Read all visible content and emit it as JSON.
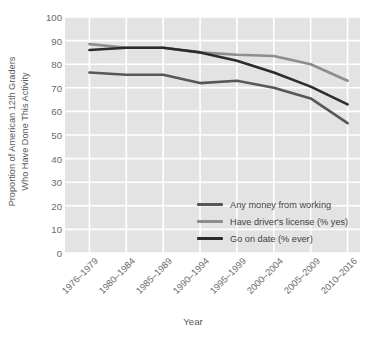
{
  "chart_data": {
    "type": "line",
    "title": "",
    "xlabel": "Year",
    "ylabel": "Proportion of American 12th Graders Who Have Done This Activity",
    "ylabel_lines": [
      "Proportion of American 12th Graders",
      "Who Have Done This Activity"
    ],
    "categories": [
      "1976–1979",
      "1980–1984",
      "1985–1989",
      "1990–1994",
      "1995–1999",
      "2000–2004",
      "2005–2009",
      "2010–2016"
    ],
    "ylim": [
      0,
      100
    ],
    "yticks": [
      0,
      10,
      20,
      30,
      40,
      50,
      60,
      70,
      80,
      90,
      100
    ],
    "ytick_labels": [
      "0",
      "10",
      "20",
      "30",
      "40",
      "50",
      "60",
      "70",
      "80",
      "90",
      "100"
    ],
    "grid": true,
    "grid_color": "#ffffff",
    "plot_bg": "#e3e3e3",
    "legend_position": "lower right",
    "series": [
      {
        "name": "Any money from working",
        "color": "#575759",
        "values": [
          76.5,
          75.5,
          75.5,
          72,
          73,
          70,
          65.5,
          55
        ]
      },
      {
        "name": "Have driver's license (% yes)",
        "color": "#8d8d8f",
        "values": [
          88.5,
          87,
          87,
          85,
          84,
          83.5,
          80,
          73
        ]
      },
      {
        "name": "Go on date (% ever)",
        "color": "#2b2b2d",
        "values": [
          86,
          87,
          87,
          85,
          81.5,
          76.5,
          70.5,
          63
        ]
      }
    ]
  }
}
